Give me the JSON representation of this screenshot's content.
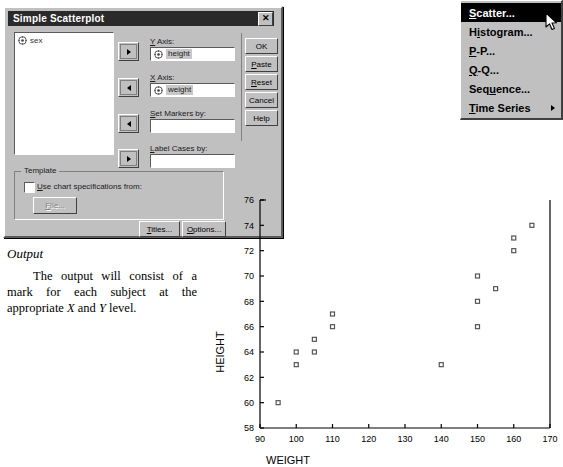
{
  "dialog": {
    "title": "Simple Scatterplot",
    "close_label": "✕",
    "variables": [
      {
        "name": "sex",
        "icon": "variable-icon"
      }
    ],
    "fields": [
      {
        "key": "y_axis",
        "label": "Y Axis:",
        "label_mnemonic": "Y",
        "value": "height",
        "has_icon": true
      },
      {
        "key": "x_axis",
        "label": "X Axis:",
        "label_mnemonic": "X",
        "value": "weight",
        "has_icon": true
      },
      {
        "key": "set_markers",
        "label": "Set Markers by:",
        "label_mnemonic": "S",
        "value": "",
        "has_icon": false
      },
      {
        "key": "label_cases",
        "label": "Label Cases by:",
        "label_mnemonic": "L",
        "value": "",
        "has_icon": false
      }
    ],
    "arrow_buttons": [
      {
        "name": "move-to-y-axis",
        "direction": "right"
      },
      {
        "name": "move-to-x-axis",
        "direction": "left"
      },
      {
        "name": "move-to-set-markers",
        "direction": "left"
      },
      {
        "name": "move-to-label-cases",
        "direction": "right"
      }
    ],
    "action_buttons": [
      {
        "label": "OK",
        "mnemonic": "",
        "enabled": true
      },
      {
        "label": "Paste",
        "mnemonic": "P",
        "enabled": true
      },
      {
        "label": "Reset",
        "mnemonic": "R",
        "enabled": true
      },
      {
        "label": "Cancel",
        "mnemonic": "",
        "enabled": true
      },
      {
        "label": "Help",
        "mnemonic": "",
        "enabled": true
      }
    ],
    "template": {
      "group_title": "Template",
      "checkbox_label": "Use chart specifications from:",
      "checkbox_mnemonic": "U",
      "checked": false,
      "file_button": "File...",
      "file_button_mnemonic": "F",
      "file_button_enabled": false
    },
    "bottom_buttons": [
      {
        "label": "Titles...",
        "mnemonic": "T"
      },
      {
        "label": "Options...",
        "mnemonic": "O"
      }
    ]
  },
  "menu": {
    "items": [
      {
        "label": "Scatter...",
        "mnemonic": "S",
        "selected": true,
        "submenu": false
      },
      {
        "label": "Histogram...",
        "mnemonic": "i",
        "selected": false,
        "submenu": false
      },
      {
        "label": "P-P...",
        "mnemonic": "P",
        "selected": false,
        "submenu": false
      },
      {
        "label": "Q-Q...",
        "mnemonic": "Q",
        "selected": false,
        "submenu": false
      },
      {
        "label": "Sequence...",
        "mnemonic": "u",
        "selected": false,
        "submenu": false
      },
      {
        "label": "Time Series",
        "mnemonic": "T",
        "selected": false,
        "submenu": true
      }
    ]
  },
  "text": {
    "heading": "Output",
    "body": "The output will consist of a mark for each subject at the appropriate X and Y level."
  },
  "chart_data": {
    "type": "scatter",
    "title": "",
    "xlabel": "WEIGHT",
    "ylabel": "HEIGHT",
    "xlim": [
      90,
      170
    ],
    "ylim": [
      58,
      76
    ],
    "xticks": [
      90,
      100,
      110,
      120,
      130,
      140,
      150,
      160,
      170
    ],
    "yticks": [
      58,
      60,
      62,
      64,
      66,
      68,
      70,
      72,
      74,
      76
    ],
    "grid": false,
    "legend": false,
    "marker": "open-square",
    "points": [
      {
        "x": 95,
        "y": 60
      },
      {
        "x": 100,
        "y": 63
      },
      {
        "x": 100,
        "y": 64
      },
      {
        "x": 105,
        "y": 64
      },
      {
        "x": 105,
        "y": 65
      },
      {
        "x": 110,
        "y": 66
      },
      {
        "x": 110,
        "y": 67
      },
      {
        "x": 140,
        "y": 63
      },
      {
        "x": 150,
        "y": 66
      },
      {
        "x": 150,
        "y": 68
      },
      {
        "x": 150,
        "y": 70
      },
      {
        "x": 155,
        "y": 69
      },
      {
        "x": 160,
        "y": 72
      },
      {
        "x": 160,
        "y": 73
      },
      {
        "x": 165,
        "y": 74
      }
    ]
  },
  "colors": {
    "dialog_face": "#c0c0c0",
    "titlebar": "#2a2a2a",
    "menu_selected_bg": "#000000",
    "field_value_bg": "#c8c8c8",
    "marker_stroke": "#555555"
  }
}
